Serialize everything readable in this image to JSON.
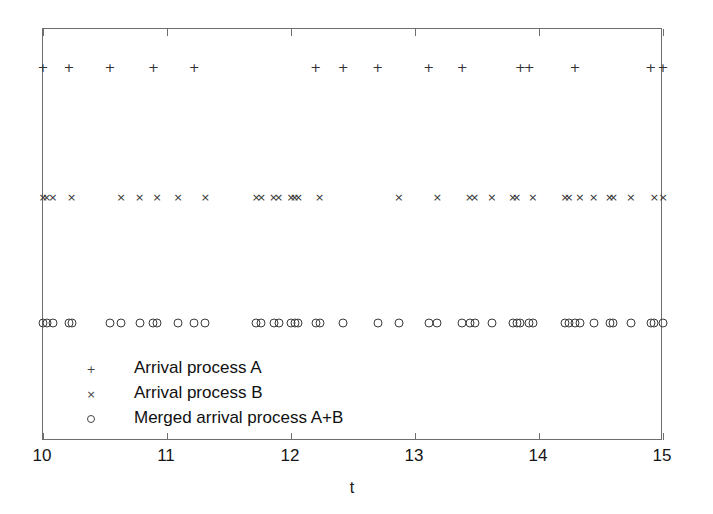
{
  "chart_data": {
    "type": "scatter",
    "title": "",
    "xlabel": "t",
    "ylabel": "",
    "xlim": [
      10,
      15
    ],
    "xticks": [
      10,
      11,
      12,
      13,
      14,
      15
    ],
    "xticklabels": [
      "10",
      "11",
      "12",
      "13",
      "14",
      "15"
    ],
    "grid": false,
    "legend_position": "lower-left-inside",
    "marker_color": "#333333",
    "axis_color": "#6e6e6e",
    "background": "#ffffff",
    "series": [
      {
        "name": "Arrival process A",
        "marker": "+",
        "row_label": "A",
        "y_level": 3,
        "x": [
          10.0,
          10.21,
          10.54,
          10.89,
          11.22,
          12.2,
          12.42,
          12.7,
          13.11,
          13.38,
          13.85,
          13.92,
          14.29,
          14.9,
          15.0
        ]
      },
      {
        "name": "Arrival process B",
        "marker": "x",
        "row_label": "B",
        "y_level": 2,
        "x": [
          10.0,
          10.03,
          10.08,
          10.23,
          10.63,
          10.78,
          10.92,
          11.09,
          11.31,
          11.72,
          11.76,
          11.86,
          11.9,
          12.0,
          12.03,
          12.06,
          12.23,
          12.87,
          13.18,
          13.44,
          13.48,
          13.62,
          13.79,
          13.82,
          13.95,
          14.21,
          14.24,
          14.33,
          14.44,
          14.57,
          14.6,
          14.74,
          14.93,
          15.0
        ]
      },
      {
        "name": "Merged arrival process A+B",
        "marker": "o",
        "row_label": "A+B",
        "y_level": 1,
        "x": [
          10.0,
          10.03,
          10.08,
          10.21,
          10.23,
          10.54,
          10.63,
          10.78,
          10.89,
          10.92,
          11.09,
          11.22,
          11.31,
          11.72,
          11.76,
          11.86,
          11.9,
          12.0,
          12.03,
          12.06,
          12.2,
          12.23,
          12.42,
          12.7,
          12.87,
          13.11,
          13.18,
          13.38,
          13.44,
          13.48,
          13.62,
          13.79,
          13.82,
          13.85,
          13.92,
          13.95,
          14.21,
          14.24,
          14.29,
          14.33,
          14.44,
          14.57,
          14.6,
          14.74,
          14.9,
          14.93,
          15.0
        ]
      }
    ]
  },
  "legend": {
    "entries": [
      {
        "label": "Arrival process A",
        "marker": "+"
      },
      {
        "label": "Arrival process B",
        "marker": "×"
      },
      {
        "label": "Merged arrival process A+B",
        "marker": "o"
      }
    ]
  },
  "axis": {
    "xlabel": "t"
  }
}
